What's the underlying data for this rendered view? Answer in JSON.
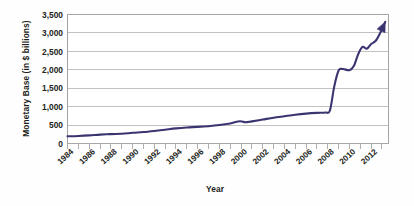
{
  "chart_data": {
    "type": "line",
    "title": "",
    "xlabel": "Year",
    "ylabel": "Monetary Base (in $ billions)",
    "xlim": [
      1984,
      2013.6
    ],
    "ylim": [
      0,
      3500
    ],
    "ytick_values": [
      0,
      500,
      1000,
      1500,
      2000,
      2500,
      3000,
      3500
    ],
    "ytick_labels": [
      "0",
      "500",
      "1,000",
      "1,500",
      "2,000",
      "2,500",
      "3,000",
      "3,500"
    ],
    "xtick_labels": [
      "1984",
      "1986",
      "1988",
      "1990",
      "1992",
      "1994",
      "1996",
      "1998",
      "2000",
      "2002",
      "2004",
      "2006",
      "2008",
      "2010",
      "2012"
    ],
    "xtick_values": [
      1984,
      1986,
      1988,
      1990,
      1992,
      1994,
      1996,
      1998,
      2000,
      2002,
      2004,
      2006,
      2008,
      2010,
      2012
    ],
    "minor_tick_interval": 1,
    "grid": "horizontal",
    "legend": "none",
    "series": [
      {
        "name": "Monetary Base",
        "color": "#3a3470",
        "line_end_marker": "arrow",
        "x": [
          1984,
          1985,
          1986,
          1987,
          1988,
          1989,
          1990,
          1991,
          1992,
          1993,
          1994,
          1995,
          1996,
          1997,
          1998,
          1999,
          1999.9,
          2000.4,
          2001,
          2002,
          2003,
          2004,
          2005,
          2006,
          2007,
          2007.8,
          2008.2,
          2008.6,
          2009,
          2009.4,
          2010,
          2010.4,
          2010.8,
          2011.2,
          2011.6,
          2012,
          2012.4,
          2012.8,
          2013.3
        ],
        "y": [
          195,
          205,
          220,
          240,
          255,
          265,
          290,
          310,
          340,
          375,
          410,
          435,
          450,
          470,
          500,
          545,
          605,
          575,
          600,
          650,
          700,
          740,
          780,
          810,
          830,
          840,
          900,
          1550,
          1980,
          2020,
          1990,
          2100,
          2420,
          2620,
          2570,
          2700,
          2780,
          2980,
          3300
        ]
      }
    ]
  }
}
